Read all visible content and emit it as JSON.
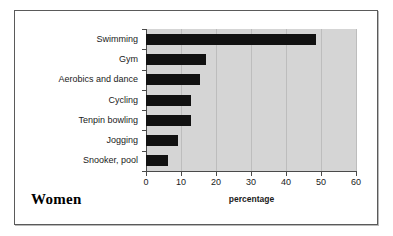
{
  "figure": {
    "panel_title": "Women",
    "background_color": "#ffffff",
    "border_color": "#5a5a5a"
  },
  "chart_data": {
    "type": "bar",
    "orientation": "horizontal",
    "title": "Women",
    "xlabel": "percentage",
    "ylabel": "",
    "xlim": [
      0,
      60
    ],
    "xticks": [
      0,
      10,
      20,
      30,
      40,
      50,
      60
    ],
    "xtick_labels": [
      "0",
      "10",
      "20",
      "30",
      "40",
      "50",
      "60"
    ],
    "grid": "vertical",
    "legend": "none",
    "plot_background": "#d5d5d5",
    "bar_color": "#111111",
    "categories": [
      "Swimming",
      "Gym",
      "Aerobics and dance",
      "Cycling",
      "Tenpin bowling",
      "Jogging",
      "Snooker, pool"
    ],
    "values": [
      48.5,
      17,
      15.5,
      12.8,
      12.8,
      9,
      6.3
    ]
  }
}
